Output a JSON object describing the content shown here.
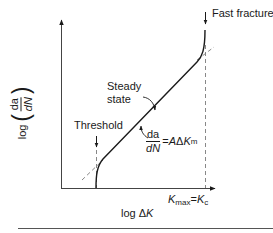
{
  "diagram": {
    "y_axis": {
      "log_text": "log",
      "frac_numerator": "da",
      "frac_denominator": "dN"
    },
    "x_axis": {
      "log_text": "log",
      "delta": "Δ",
      "variable": "K"
    },
    "labels": {
      "fast_fracture": "Fast fracture",
      "threshold": "Threshold",
      "steady_state_line1": "Steady",
      "steady_state_line2": "state",
      "kmax_K": "K",
      "kmax_sub": "max",
      "kmax_eq": "=",
      "kc_K": "K",
      "kc_sub": "c"
    },
    "equation": {
      "numerator": "da",
      "denominator": "dN",
      "rhs_eq": "= ",
      "rhs_A": "A",
      "rhs_delta": "Δ",
      "rhs_K": "K",
      "rhs_exp": "m"
    },
    "regions": [
      "Threshold",
      "Steady state",
      "Fast fracture"
    ],
    "colors": {
      "line": "#1a1a1a",
      "dashed": "#7a7a7a",
      "axis": "#333333",
      "separator": "#555555"
    }
  }
}
